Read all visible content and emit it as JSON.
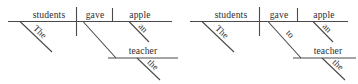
{
  "figure": {
    "type": "sentence-diagram-pair",
    "background_color": "#ffffff",
    "line_color": "#4a4a4a",
    "text_color": "#2e2e2e"
  },
  "diagrams": [
    {
      "id": "diagram-left",
      "sentence": "The students gave the teacher an apple.",
      "baseline_words": [
        {
          "role": "subject",
          "text": "students"
        },
        {
          "role": "verb",
          "text": "gave"
        },
        {
          "role": "direct-object",
          "text": "apple"
        }
      ],
      "modifiers": [
        {
          "role": "subject-modifier",
          "text": "The",
          "attaches_to": "students"
        },
        {
          "role": "object-modifier",
          "text": "an",
          "attaches_to": "apple"
        },
        {
          "role": "indirect-object-modifier",
          "text": "the",
          "attaches_to": "teacher"
        }
      ],
      "branch": {
        "role": "indirect-object",
        "text": "teacher",
        "preposition": ""
      },
      "dividers": [
        {
          "role": "subject-verb-divider",
          "style": "full"
        },
        {
          "role": "verb-object-divider",
          "style": "half"
        }
      ]
    },
    {
      "id": "diagram-right",
      "sentence": "The students gave an apple to the teacher.",
      "baseline_words": [
        {
          "role": "subject",
          "text": "students"
        },
        {
          "role": "verb",
          "text": "gave"
        },
        {
          "role": "direct-object",
          "text": "apple"
        }
      ],
      "modifiers": [
        {
          "role": "subject-modifier",
          "text": "The",
          "attaches_to": "students"
        },
        {
          "role": "object-modifier",
          "text": "an",
          "attaches_to": "apple"
        },
        {
          "role": "prepositional-object-modifier",
          "text": "the",
          "attaches_to": "teacher"
        }
      ],
      "branch": {
        "role": "prepositional-object",
        "text": "teacher",
        "preposition": "to"
      },
      "dividers": [
        {
          "role": "subject-verb-divider",
          "style": "full"
        },
        {
          "role": "verb-object-divider",
          "style": "half"
        }
      ]
    }
  ]
}
